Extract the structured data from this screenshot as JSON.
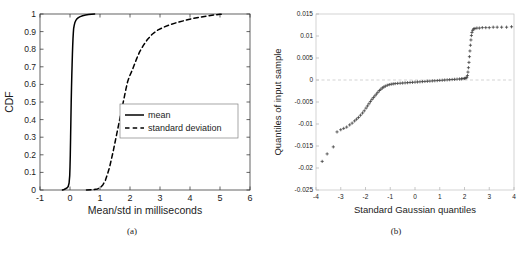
{
  "figure": {
    "captions": [
      {
        "id": "a",
        "label": "(a)"
      },
      {
        "id": "b",
        "label": "(b)"
      }
    ],
    "bottom_fragment": "clipped text"
  },
  "chart_data": [
    {
      "type": "line",
      "panel": "(a)",
      "title": "",
      "xlabel": "Mean/std in milliseconds",
      "ylabel": "CDF",
      "xlim": [
        -1,
        6
      ],
      "ylim": [
        0,
        1
      ],
      "xticks": [
        -1,
        0,
        1,
        2,
        3,
        4,
        5,
        6
      ],
      "xticklabels": [
        "-1",
        "0",
        "1",
        "2",
        "3",
        "4",
        "5",
        "6"
      ],
      "yticks": [
        0,
        0.1,
        0.2,
        0.3,
        0.4,
        0.5,
        0.6,
        0.7,
        0.8,
        0.9,
        1
      ],
      "yticklabels": [
        "0",
        "0.1",
        "0.2",
        "0.3",
        "0.4",
        "0.5",
        "0.6",
        "0.7",
        "0.8",
        "0.9",
        "1"
      ],
      "grid": false,
      "legend": {
        "position": "center-right",
        "entries": [
          {
            "label": "mean",
            "style": "solid",
            "color": "#000000"
          },
          {
            "label": "standard deviation",
            "style": "dashed",
            "color": "#000000"
          }
        ]
      },
      "series": [
        {
          "name": "mean",
          "style": "solid",
          "color": "#000000",
          "points": [
            [
              -0.25,
              0.0
            ],
            [
              -0.2,
              0.003
            ],
            [
              -0.15,
              0.007
            ],
            [
              -0.1,
              0.012
            ],
            [
              -0.06,
              0.02
            ],
            [
              -0.03,
              0.04
            ],
            [
              -0.01,
              0.08
            ],
            [
              0.0,
              0.13
            ],
            [
              0.01,
              0.2
            ],
            [
              0.02,
              0.3
            ],
            [
              0.03,
              0.4
            ],
            [
              0.04,
              0.5
            ],
            [
              0.05,
              0.58
            ],
            [
              0.06,
              0.65
            ],
            [
              0.07,
              0.71
            ],
            [
              0.08,
              0.77
            ],
            [
              0.09,
              0.82
            ],
            [
              0.1,
              0.86
            ],
            [
              0.11,
              0.89
            ],
            [
              0.12,
              0.915
            ],
            [
              0.14,
              0.935
            ],
            [
              0.16,
              0.95
            ],
            [
              0.19,
              0.962
            ],
            [
              0.23,
              0.972
            ],
            [
              0.28,
              0.979
            ],
            [
              0.34,
              0.985
            ],
            [
              0.42,
              0.99
            ],
            [
              0.52,
              0.994
            ],
            [
              0.62,
              0.997
            ],
            [
              0.72,
              0.999
            ],
            [
              0.82,
              1.0
            ]
          ]
        },
        {
          "name": "standard deviation",
          "style": "dashed",
          "color": "#000000",
          "points": [
            [
              0.55,
              0.0
            ],
            [
              0.75,
              0.002
            ],
            [
              0.92,
              0.006
            ],
            [
              1.02,
              0.015
            ],
            [
              1.1,
              0.03
            ],
            [
              1.18,
              0.055
            ],
            [
              1.25,
              0.09
            ],
            [
              1.32,
              0.13
            ],
            [
              1.38,
              0.175
            ],
            [
              1.44,
              0.22
            ],
            [
              1.5,
              0.27
            ],
            [
              1.56,
              0.32
            ],
            [
              1.62,
              0.37
            ],
            [
              1.68,
              0.42
            ],
            [
              1.74,
              0.47
            ],
            [
              1.8,
              0.52
            ],
            [
              1.86,
              0.57
            ],
            [
              1.92,
              0.615
            ],
            [
              1.98,
              0.645
            ],
            [
              2.06,
              0.675
            ],
            [
              2.14,
              0.71
            ],
            [
              2.22,
              0.745
            ],
            [
              2.32,
              0.785
            ],
            [
              2.44,
              0.82
            ],
            [
              2.58,
              0.855
            ],
            [
              2.74,
              0.885
            ],
            [
              2.92,
              0.908
            ],
            [
              3.12,
              0.925
            ],
            [
              3.34,
              0.94
            ],
            [
              3.58,
              0.952
            ],
            [
              3.82,
              0.963
            ],
            [
              4.06,
              0.973
            ],
            [
              4.3,
              0.981
            ],
            [
              4.54,
              0.988
            ],
            [
              4.78,
              0.994
            ],
            [
              5.0,
              0.998
            ],
            [
              5.12,
              1.0
            ]
          ]
        }
      ]
    },
    {
      "type": "scatter",
      "panel": "(b)",
      "title": "",
      "xlabel": "Standard Gaussian quantiles",
      "ylabel": "Quantiles of input sample",
      "xlim": [
        -4,
        4
      ],
      "ylim": [
        -0.025,
        0.015
      ],
      "xticks": [
        -4,
        -3,
        -2,
        -1,
        0,
        1,
        2,
        3,
        4
      ],
      "xticklabels": [
        "-4",
        "-3",
        "-2",
        "-1",
        "0",
        "1",
        "2",
        "3",
        "4"
      ],
      "yticks": [
        -0.025,
        -0.02,
        -0.015,
        -0.01,
        -0.005,
        0,
        0.005,
        0.01,
        0.015
      ],
      "yticklabels": [
        "-0.025",
        "-0.02",
        "-0.015",
        "-0.01",
        "-0.005",
        "0",
        "0.005",
        "0.01",
        "0.015"
      ],
      "grid": false,
      "reference_line": {
        "style": "dashed",
        "color": "#c8c8c8",
        "y": 0
      },
      "marker": {
        "shape": "plus",
        "color": "#3a3a3a",
        "size": 1.6
      },
      "points": [
        [
          -3.75,
          -0.0185
        ],
        [
          -3.55,
          -0.0168
        ],
        [
          -3.3,
          -0.0152
        ],
        [
          -3.15,
          -0.0118
        ],
        [
          -3.0,
          -0.0113
        ],
        [
          -2.88,
          -0.011
        ],
        [
          -2.76,
          -0.0107
        ],
        [
          -2.64,
          -0.0102
        ],
        [
          -2.54,
          -0.0098
        ],
        [
          -2.44,
          -0.0093
        ],
        [
          -2.36,
          -0.0089
        ],
        [
          -2.28,
          -0.0085
        ],
        [
          -2.2,
          -0.008
        ],
        [
          -2.12,
          -0.0075
        ],
        [
          -2.05,
          -0.007
        ],
        [
          -1.98,
          -0.0064
        ],
        [
          -1.92,
          -0.0059
        ],
        [
          -1.86,
          -0.0054
        ],
        [
          -1.8,
          -0.0049
        ],
        [
          -1.74,
          -0.0044
        ],
        [
          -1.68,
          -0.004
        ],
        [
          -1.62,
          -0.0036
        ],
        [
          -1.56,
          -0.0032
        ],
        [
          -1.5,
          -0.0028
        ],
        [
          -1.44,
          -0.0024
        ],
        [
          -1.38,
          -0.0021
        ],
        [
          -1.32,
          -0.0018
        ],
        [
          -1.26,
          -0.0016
        ],
        [
          -1.2,
          -0.0014
        ],
        [
          -1.12,
          -0.0012
        ],
        [
          -1.04,
          -0.00105
        ],
        [
          -0.96,
          -0.00095
        ],
        [
          -0.88,
          -0.00088
        ],
        [
          -0.8,
          -0.00082
        ],
        [
          -0.7,
          -0.00077
        ],
        [
          -0.6,
          -0.00073
        ],
        [
          -0.5,
          -0.00069
        ],
        [
          -0.4,
          -0.00065
        ],
        [
          -0.3,
          -0.00061
        ],
        [
          -0.2,
          -0.00057
        ],
        [
          -0.1,
          -0.00053
        ],
        [
          0.0,
          -0.00049
        ],
        [
          0.1,
          -0.00045
        ],
        [
          0.2,
          -0.00041
        ],
        [
          0.3,
          -0.00037
        ],
        [
          0.4,
          -0.00033
        ],
        [
          0.5,
          -0.00029
        ],
        [
          0.6,
          -0.00025
        ],
        [
          0.7,
          -0.00021
        ],
        [
          0.8,
          -0.00017
        ],
        [
          0.9,
          -0.00013
        ],
        [
          1.0,
          -9e-05
        ],
        [
          1.1,
          -5e-05
        ],
        [
          1.2,
          -1e-05
        ],
        [
          1.3,
          3e-05
        ],
        [
          1.4,
          7e-05
        ],
        [
          1.5,
          0.00011
        ],
        [
          1.6,
          0.00015
        ],
        [
          1.7,
          0.00019
        ],
        [
          1.8,
          0.00023
        ],
        [
          1.88,
          0.00027
        ],
        [
          1.94,
          0.00031
        ],
        [
          2.0,
          0.00036
        ],
        [
          2.05,
          0.00042
        ],
        [
          2.09,
          0.00055
        ],
        [
          2.12,
          0.001
        ],
        [
          2.14,
          0.0018
        ],
        [
          2.16,
          0.0028
        ],
        [
          2.18,
          0.004
        ],
        [
          2.2,
          0.0053
        ],
        [
          2.22,
          0.0066
        ],
        [
          2.24,
          0.0079
        ],
        [
          2.26,
          0.0091
        ],
        [
          2.28,
          0.0101
        ],
        [
          2.3,
          0.0108
        ],
        [
          2.33,
          0.0113
        ],
        [
          2.37,
          0.0116
        ],
        [
          2.42,
          0.0117
        ],
        [
          2.5,
          0.0118
        ],
        [
          2.6,
          0.0118
        ],
        [
          2.72,
          0.0119
        ],
        [
          2.86,
          0.0119
        ],
        [
          3.0,
          0.0119
        ],
        [
          3.16,
          0.012
        ],
        [
          3.32,
          0.012
        ],
        [
          3.5,
          0.012
        ],
        [
          3.7,
          0.012
        ],
        [
          3.9,
          0.0121
        ]
      ]
    }
  ]
}
